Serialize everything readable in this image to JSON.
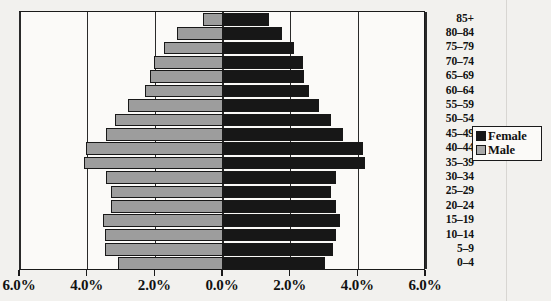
{
  "chart_data": {
    "type": "bar",
    "subtype": "population-pyramid",
    "title": "",
    "xlabel": "",
    "ylabel": "",
    "orientation": "horizontal",
    "grid": true,
    "legend_position": "right",
    "categories": [
      "0–4",
      "5–9",
      "10–14",
      "15–19",
      "20–24",
      "25–29",
      "30–34",
      "35–39",
      "40–44",
      "45–49",
      "50–54",
      "55–59",
      "60–64",
      "65–69",
      "70–74",
      "75–79",
      "80–84",
      "85+"
    ],
    "series": [
      {
        "name": "Male",
        "color": "#9d9d9d",
        "side": "left",
        "values": [
          3.1,
          3.5,
          3.5,
          3.55,
          3.3,
          3.3,
          3.45,
          4.1,
          4.05,
          3.45,
          3.2,
          2.8,
          2.3,
          2.15,
          2.05,
          1.75,
          1.35,
          0.6
        ]
      },
      {
        "name": "Female",
        "color": "#171717",
        "side": "right",
        "values": [
          3.0,
          3.25,
          3.35,
          3.45,
          3.35,
          3.2,
          3.35,
          4.2,
          4.15,
          3.55,
          3.2,
          2.85,
          2.55,
          2.4,
          2.35,
          2.1,
          1.75,
          1.35
        ]
      }
    ],
    "x_ticks": [
      "6.0%",
      "4.0%",
      "2.0%",
      "0.0%",
      "2.0%",
      "4.0%",
      "6.0%"
    ],
    "x_tick_values": [
      -6,
      -4,
      -2,
      0,
      2,
      4,
      6
    ],
    "xlim": [
      -6,
      6
    ],
    "axis_unit": "percent"
  },
  "legend": {
    "items": [
      {
        "label": "Female",
        "swatch": "female"
      },
      {
        "label": "Male",
        "swatch": "male"
      }
    ]
  }
}
